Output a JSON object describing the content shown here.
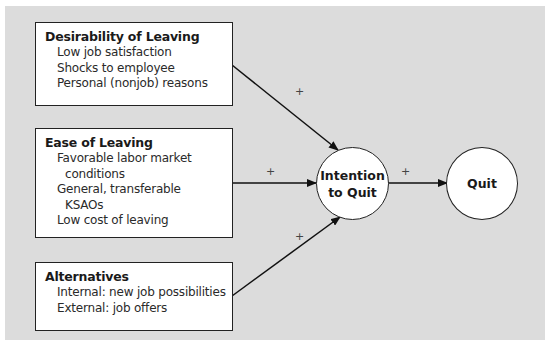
{
  "diagram": {
    "type": "causal-model",
    "background_color": "#dcdcdc",
    "boxes": [
      {
        "id": "desirability",
        "title": "Desirability of Leaving",
        "items": [
          "Low job satisfaction",
          "Shocks to employee",
          "Personal (nonjob) reasons"
        ]
      },
      {
        "id": "ease",
        "title": "Ease of Leaving",
        "items": [
          "Favorable labor market",
          "conditions",
          "General, transferable",
          "KSAOs",
          "Low cost of leaving"
        ]
      },
      {
        "id": "alternatives",
        "title": "Alternatives",
        "items": [
          "Internal: new job possibilities",
          "External: job offers"
        ]
      }
    ],
    "nodes": [
      {
        "id": "intention",
        "label_line1": "Intention",
        "label_line2": "to Quit"
      },
      {
        "id": "quit",
        "label": "Quit"
      }
    ],
    "edges": [
      {
        "from": "desirability",
        "to": "intention",
        "sign": "+"
      },
      {
        "from": "ease",
        "to": "intention",
        "sign": "+"
      },
      {
        "from": "alternatives",
        "to": "intention",
        "sign": "+"
      },
      {
        "from": "intention",
        "to": "quit",
        "sign": "+"
      }
    ]
  }
}
